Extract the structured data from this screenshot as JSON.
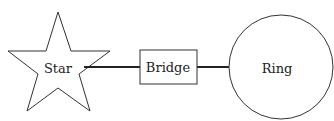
{
  "diagram": {
    "nodes": [
      {
        "id": "star",
        "label": "Star",
        "shape": "star"
      },
      {
        "id": "bridge",
        "label": "Bridge",
        "shape": "rectangle"
      },
      {
        "id": "ring",
        "label": "Ring",
        "shape": "circle"
      }
    ],
    "edges": [
      {
        "from": "star",
        "to": "bridge"
      },
      {
        "from": "bridge",
        "to": "ring"
      }
    ],
    "colors": {
      "stroke": "#333333",
      "background": "#ffffff"
    }
  }
}
